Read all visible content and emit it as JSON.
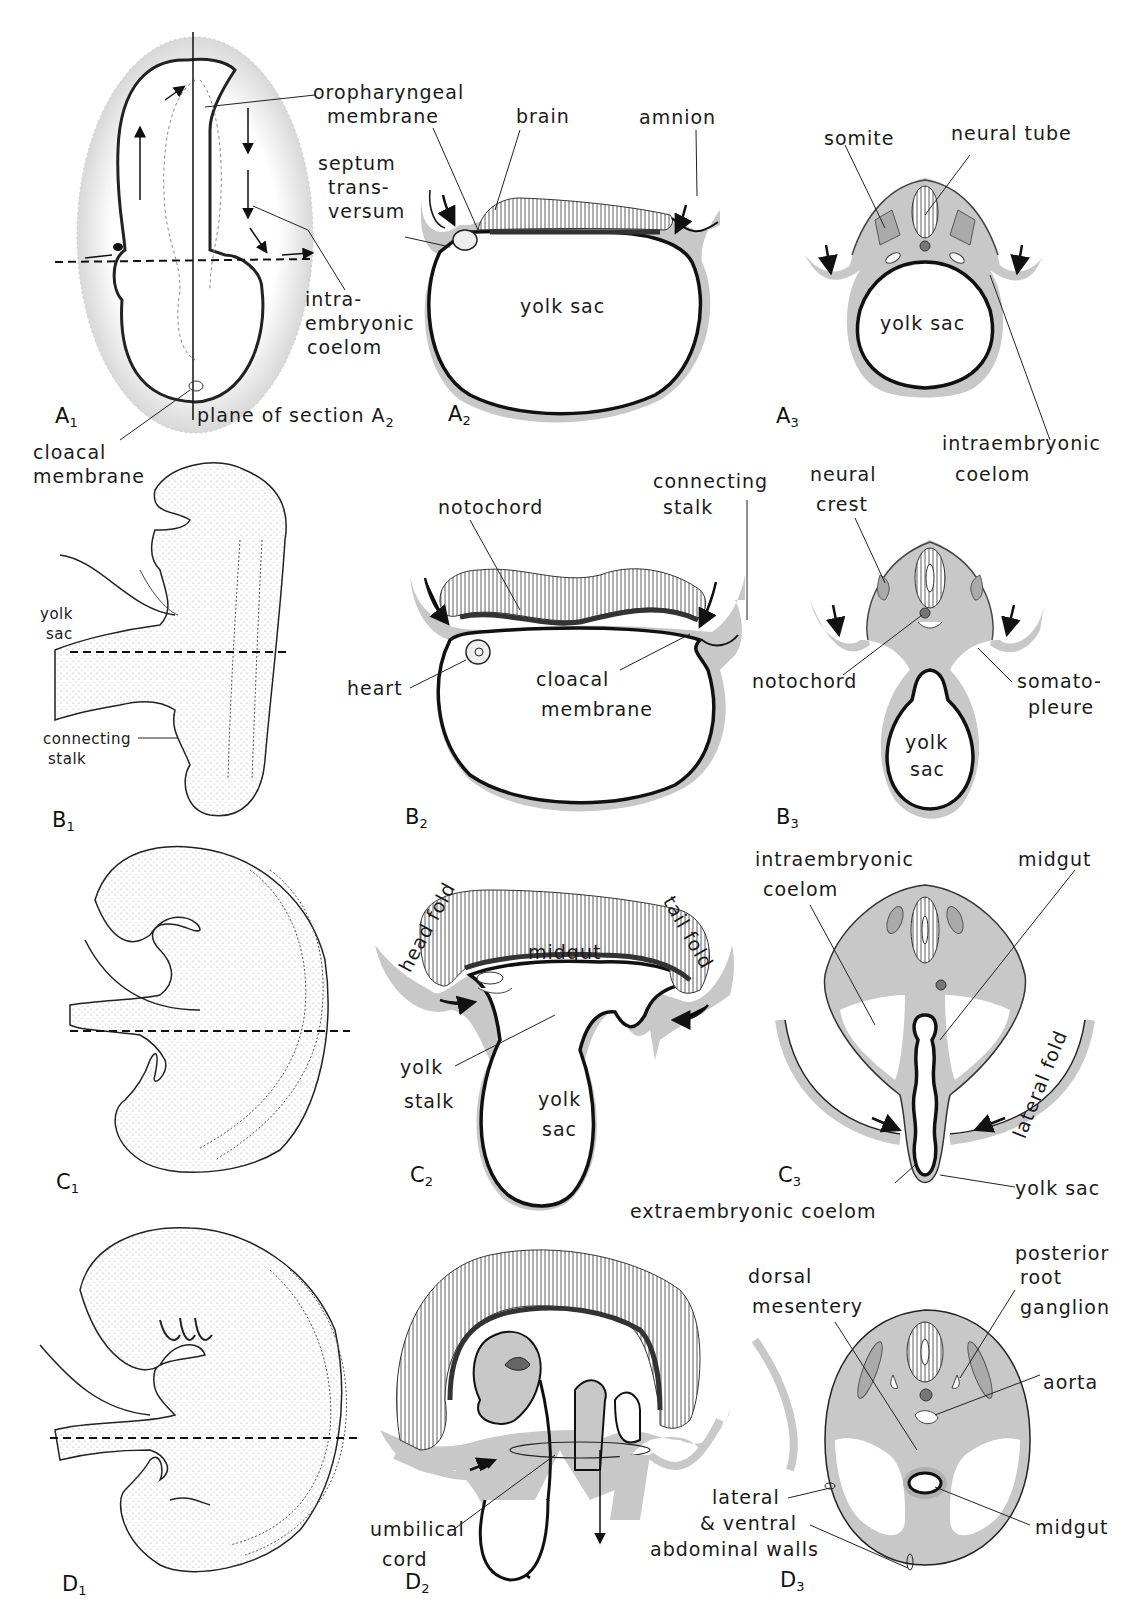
{
  "figure": {
    "rows": [
      "A",
      "B",
      "C",
      "D"
    ],
    "columns": [
      "1 (whole embryo, lateral/dorsal view)",
      "2 (median sagittal section)",
      "3 (transverse section)"
    ],
    "panel_ids": {
      "A1": {
        "letter": "A",
        "sub": "1"
      },
      "A2": {
        "letter": "A",
        "sub": "2"
      },
      "A3": {
        "letter": "A",
        "sub": "3"
      },
      "B1": {
        "letter": "B",
        "sub": "1"
      },
      "B2": {
        "letter": "B",
        "sub": "2"
      },
      "B3": {
        "letter": "B",
        "sub": "3"
      },
      "C1": {
        "letter": "C",
        "sub": "1"
      },
      "C2": {
        "letter": "C",
        "sub": "2"
      },
      "C3": {
        "letter": "C",
        "sub": "3"
      },
      "D1": {
        "letter": "D",
        "sub": "1"
      },
      "D2": {
        "letter": "D",
        "sub": "2"
      },
      "D3": {
        "letter": "D",
        "sub": "3"
      }
    }
  },
  "labels": {
    "A": {
      "oropharyngeal_1": "oropharyngeal",
      "oropharyngeal_2": "membrane",
      "septum_1": "septum",
      "septum_2": "trans-",
      "septum_3": "versum",
      "intra_1": "intra-",
      "intra_2": "embryonic",
      "intra_3": "coelom",
      "plane": "plane of section A",
      "plane_sub": "2",
      "cloacal_1": "cloacal",
      "cloacal_2": "membrane",
      "brain": "brain",
      "amnion": "amnion",
      "yolk_sac_2": "yolk sac",
      "somite": "somite",
      "neural_tube": "neural tube",
      "yolk_sac_3": "yolk sac",
      "intraemb_1": "intraembryonic",
      "intraemb_2": "coelom"
    },
    "B": {
      "yolk_1": "yolk",
      "yolk_2": "sac",
      "connecting_1": "connecting",
      "connecting_2": "stalk",
      "notochord_2": "notochord",
      "conn_stalk_1": "connecting",
      "conn_stalk_2": "stalk",
      "heart": "heart",
      "cloacal_1": "cloacal",
      "cloacal_2": "membrane",
      "neural_crest_1": "neural",
      "neural_crest_2": "crest",
      "notochord_3": "notochord",
      "somato_1": "somato-",
      "somato_2": "pleure",
      "yolk_sac_1": "yolk",
      "yolk_sac_2": "sac"
    },
    "C": {
      "head_fold": "head fold",
      "tail_fold": "tail fold",
      "midgut_2": "midgut",
      "yolk_stalk_1": "yolk",
      "yolk_stalk_2": "stalk",
      "yolk_sac_1": "yolk",
      "yolk_sac_2": "sac",
      "intraemb_1": "intraembryonic",
      "intraemb_2": "coelom",
      "midgut_3": "midgut",
      "lateral_fold": "lateral fold",
      "yolk_sac_3": "yolk sac",
      "extraemb": "extraembryonic coelom"
    },
    "D": {
      "umbilical_1": "umbilical",
      "umbilical_2": "cord",
      "dorsal_1": "dorsal",
      "dorsal_2": "mesentery",
      "prg_1": "posterior",
      "prg_2": "root",
      "prg_3": "ganglion",
      "aorta": "aorta",
      "lateral_1": "lateral",
      "lateral_2": "& ventral",
      "lateral_3": "abdominal walls",
      "midgut": "midgut"
    }
  },
  "colors": {
    "ink": "#1a1a1a",
    "tissue_gray": "#c8c8c8",
    "mesoderm_gray": "#b4b4b4",
    "notochord_dark": "#666666",
    "paper": "#ffffff"
  }
}
